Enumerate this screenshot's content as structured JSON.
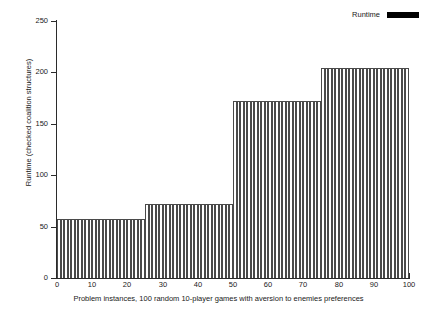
{
  "chart_data": {
    "type": "bar",
    "title": "",
    "xlabel": "Problem instances, 100 random 10-player games with aversion to enemies preferences",
    "ylabel": "Runtime (checked coalition structures)",
    "xlim": [
      0,
      100
    ],
    "ylim": [
      0,
      250
    ],
    "grid": false,
    "legend_position": "top-right",
    "legend": [
      "Runtime"
    ],
    "xticks": [
      0,
      10,
      20,
      30,
      40,
      50,
      60,
      70,
      80,
      90,
      100
    ],
    "yticks": [
      0,
      50,
      100,
      150,
      200,
      250
    ],
    "series": [
      {
        "name": "Runtime",
        "color": "#000000",
        "x": [
          1,
          2,
          3,
          4,
          5,
          6,
          7,
          8,
          9,
          10,
          11,
          12,
          13,
          14,
          15,
          16,
          17,
          18,
          19,
          20,
          21,
          22,
          23,
          24,
          25,
          26,
          27,
          28,
          29,
          30,
          31,
          32,
          33,
          34,
          35,
          36,
          37,
          38,
          39,
          40,
          41,
          42,
          43,
          44,
          45,
          46,
          47,
          48,
          49,
          50,
          51,
          52,
          53,
          54,
          55,
          56,
          57,
          58,
          59,
          60,
          61,
          62,
          63,
          64,
          65,
          66,
          67,
          68,
          69,
          70,
          71,
          72,
          73,
          74,
          75,
          76,
          77,
          78,
          79,
          80,
          81,
          82,
          83,
          84,
          85,
          86,
          87,
          88,
          89,
          90,
          91,
          92,
          93,
          94,
          95,
          96,
          97,
          98,
          99,
          100
        ],
        "values": [
          57,
          57,
          57,
          57,
          57,
          57,
          57,
          57,
          57,
          57,
          57,
          57,
          57,
          57,
          57,
          57,
          57,
          57,
          57,
          57,
          57,
          57,
          57,
          57,
          57,
          72,
          72,
          72,
          72,
          72,
          72,
          72,
          72,
          72,
          72,
          72,
          72,
          72,
          72,
          72,
          72,
          72,
          72,
          72,
          72,
          72,
          72,
          72,
          72,
          72,
          172,
          172,
          172,
          172,
          172,
          172,
          172,
          172,
          172,
          172,
          172,
          172,
          172,
          172,
          172,
          172,
          172,
          172,
          172,
          172,
          172,
          172,
          172,
          172,
          172,
          204,
          204,
          204,
          204,
          204,
          204,
          204,
          204,
          204,
          204,
          204,
          204,
          204,
          204,
          204,
          204,
          204,
          204,
          204,
          204,
          204,
          204,
          204,
          204,
          204
        ]
      }
    ],
    "plateaus": [
      {
        "x_start": 0,
        "x_end": 25,
        "value": 57
      },
      {
        "x_start": 25,
        "x_end": 50,
        "value": 72
      },
      {
        "x_start": 50,
        "x_end": 75,
        "value": 172
      },
      {
        "x_start": 75,
        "x_end": 100,
        "value": 204
      }
    ]
  }
}
